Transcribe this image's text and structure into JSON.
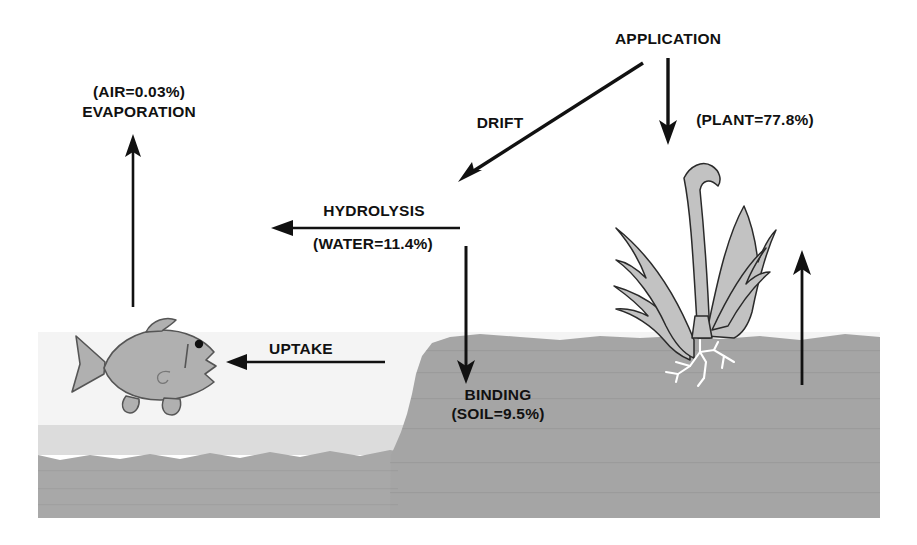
{
  "diagram": {
    "title_text": "Environmental fate of applied pesticide",
    "labels": {
      "application": "APPLICATION",
      "drift": "DRIFT",
      "plant_fraction": "(PLANT=77.8%)",
      "air_fraction": "(AIR=0.03%)",
      "evaporation": "EVAPORATION",
      "hydrolysis": "HYDROLYSIS",
      "water_fraction": "(WATER=11.4%)",
      "uptake": "UPTAKE",
      "binding": "BINDING",
      "soil_fraction": "(SOIL=9.5%)"
    },
    "compartments": [
      {
        "name": "PLANT",
        "value": "77.8%"
      },
      {
        "name": "WATER",
        "value": "11.4%"
      },
      {
        "name": "SOIL",
        "value": "9.5%"
      },
      {
        "name": "AIR",
        "value": "0.03%"
      }
    ],
    "processes": [
      "APPLICATION",
      "DRIFT",
      "EVAPORATION",
      "HYDROLYSIS",
      "UPTAKE",
      "BINDING"
    ],
    "colors": {
      "ink": "#111111",
      "page": "#ffffff",
      "water_upper": "#f4f4f4",
      "water_lower": "#d8d8d8",
      "sediment": "#a8a8a8",
      "soil": "#a5a5a5",
      "plant_fill": "#c2c2c2",
      "plant_outline": "#2a2a2a",
      "fish_fill": "#b0b0b0",
      "fish_outline": "#555555",
      "root": "#ffffff"
    }
  }
}
